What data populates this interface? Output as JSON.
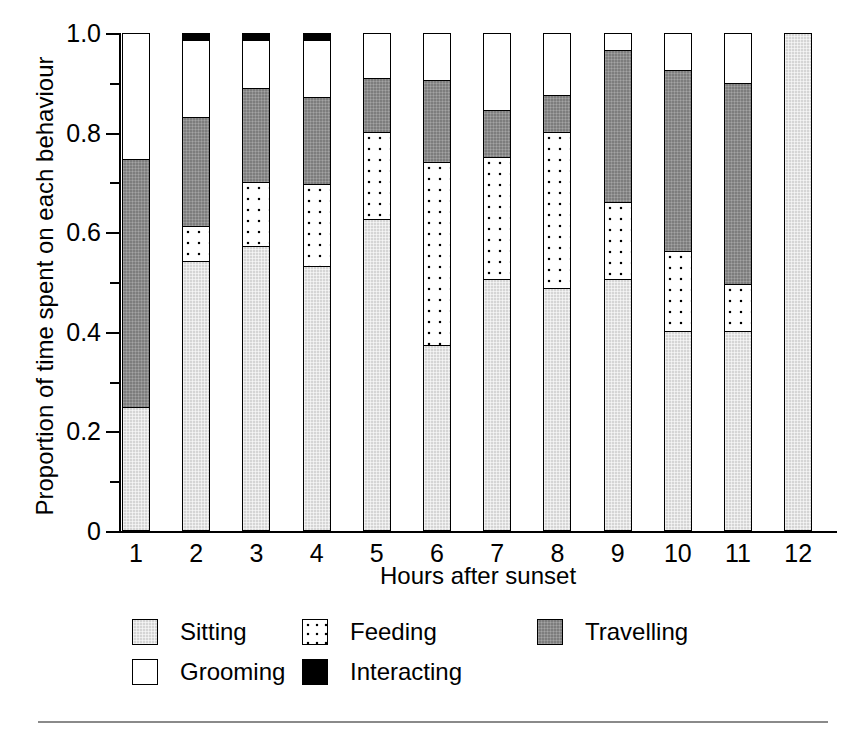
{
  "top_caption_sliver": "",
  "axes": {
    "ylabel": "Proportion of time spent on each behaviour",
    "xlabel": "Hours after sunset",
    "ytick_labels": [
      "0",
      "0.2",
      "0.4",
      "0.6",
      "0.8",
      "1.0"
    ],
    "ytick_values": [
      0,
      0.2,
      0.4,
      0.6,
      0.8,
      1.0
    ],
    "yminor_values": [
      0.1,
      0.3,
      0.5,
      0.7,
      0.9
    ],
    "xtick_labels": [
      "1",
      "2",
      "3",
      "4",
      "5",
      "6",
      "7",
      "8",
      "9",
      "10",
      "11",
      "12"
    ]
  },
  "legend": {
    "rows": [
      [
        {
          "label": "Sitting",
          "key": "sitting",
          "color": "#d5d5d5"
        },
        {
          "label": "Feeding",
          "key": "feeding",
          "color": "#ffffff"
        },
        {
          "label": "Travelling",
          "key": "travelling",
          "color": "#7d7d7d"
        }
      ],
      [
        {
          "label": "Grooming",
          "key": "grooming",
          "color": "#ffffff"
        },
        {
          "label": "Interacting",
          "key": "interacting",
          "color": "#000000"
        }
      ]
    ]
  },
  "chart_data": {
    "type": "bar",
    "stacked": true,
    "title": "",
    "xlabel": "Hours after sunset",
    "ylabel": "Proportion of time spent on each behaviour",
    "ylim": [
      0,
      1.0
    ],
    "yticks": [
      0,
      0.2,
      0.4,
      0.6,
      0.8,
      1.0
    ],
    "grid": false,
    "legend_position": "bottom",
    "categories": [
      "1",
      "2",
      "3",
      "4",
      "5",
      "6",
      "7",
      "8",
      "9",
      "10",
      "11",
      "12"
    ],
    "series": [
      {
        "name": "Sitting",
        "color": "#d5d5d5",
        "values": [
          0.245,
          0.54,
          0.57,
          0.53,
          0.625,
          0.37,
          0.505,
          0.485,
          0.505,
          0.4,
          0.4,
          1.0
        ]
      },
      {
        "name": "Feeding",
        "color": "#ffffff",
        "values": [
          0.0,
          0.07,
          0.13,
          0.165,
          0.175,
          0.37,
          0.245,
          0.315,
          0.155,
          0.16,
          0.095,
          0.0
        ]
      },
      {
        "name": "Travelling",
        "color": "#7d7d7d",
        "values": [
          0.5,
          0.22,
          0.19,
          0.175,
          0.11,
          0.165,
          0.095,
          0.075,
          0.305,
          0.365,
          0.405,
          0.0
        ]
      },
      {
        "name": "Grooming",
        "color": "#ffffff",
        "values": [
          0.255,
          0.155,
          0.095,
          0.115,
          0.09,
          0.095,
          0.155,
          0.125,
          0.035,
          0.075,
          0.1,
          0.0
        ]
      },
      {
        "name": "Interacting",
        "color": "#000000",
        "values": [
          0.0,
          0.015,
          0.015,
          0.015,
          0.0,
          0.0,
          0.0,
          0.0,
          0.0,
          0.0,
          0.0,
          0.0
        ]
      }
    ],
    "cumulative_tops": {
      "sitting": [
        0.245,
        0.54,
        0.57,
        0.53,
        0.625,
        0.37,
        0.505,
        0.485,
        0.505,
        0.4,
        0.4,
        1.0
      ],
      "feeding": [
        0.245,
        0.61,
        0.7,
        0.695,
        0.8,
        0.74,
        0.75,
        0.8,
        0.66,
        0.56,
        0.495,
        1.0
      ],
      "travelling": [
        0.745,
        0.83,
        0.89,
        0.87,
        0.91,
        0.905,
        0.845,
        0.875,
        0.965,
        0.925,
        0.9,
        1.0
      ],
      "grooming": [
        1.0,
        0.985,
        0.985,
        0.985,
        1.0,
        1.0,
        1.0,
        1.0,
        1.0,
        1.0,
        1.0,
        1.0
      ],
      "interacting": [
        1.0,
        1.0,
        1.0,
        1.0,
        1.0,
        1.0,
        1.0,
        1.0,
        1.0,
        1.0,
        1.0,
        1.0
      ]
    }
  }
}
